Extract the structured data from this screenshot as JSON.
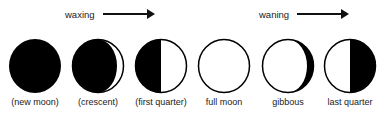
{
  "directions": [
    {
      "label": "waxing"
    },
    {
      "label": "waning"
    }
  ],
  "phases": [
    {
      "label": "(new moon)"
    },
    {
      "label": "(crescent)"
    },
    {
      "label": "(first quarter)"
    },
    {
      "label": "full moon"
    },
    {
      "label": "gibbous"
    },
    {
      "label": "last quarter"
    }
  ]
}
